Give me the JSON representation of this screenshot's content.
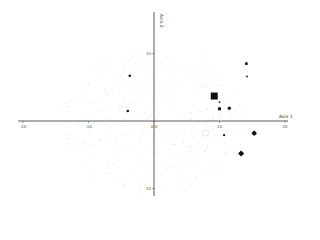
{
  "chart_data": {
    "type": "scatter",
    "title": "",
    "xlabel": "Axis 1",
    "ylabel": "Axis 2",
    "xlim": [
      -20,
      20
    ],
    "ylim": [
      -10,
      12
    ],
    "grid": false,
    "legend": null,
    "x_ticks": [
      {
        "value": -20,
        "label": "-20"
      },
      {
        "value": -10,
        "label": "-10"
      },
      {
        "value": 0,
        "label": "0.0"
      },
      {
        "value": 10,
        "label": "10"
      },
      {
        "value": 20,
        "label": "20"
      }
    ],
    "y_ticks": [
      {
        "value": 10,
        "label": "10"
      },
      {
        "value": -10,
        "label": "-10"
      }
    ],
    "series": [
      {
        "name": "background points",
        "marker": "faint-dot",
        "color": "#d8d8d8",
        "points": "many light grey points scattered around origin"
      },
      {
        "name": "highlighted",
        "color": "#111111",
        "points": [
          {
            "x": -3.7,
            "y": 6.7,
            "marker": "dot",
            "size": 2.5
          },
          {
            "x": -4.0,
            "y": 1.5,
            "marker": "dot",
            "size": 2.5
          },
          {
            "x": 9.2,
            "y": 3.7,
            "marker": "square",
            "size": 7
          },
          {
            "x": 10.0,
            "y": 2.8,
            "marker": "dot",
            "size": 1.8
          },
          {
            "x": 10.0,
            "y": 1.8,
            "marker": "square",
            "size": 3
          },
          {
            "x": 11.5,
            "y": 1.9,
            "marker": "diamond",
            "size": 4
          },
          {
            "x": 14.1,
            "y": 8.5,
            "marker": "square",
            "size": 2.6
          },
          {
            "x": 14.2,
            "y": 6.6,
            "marker": "dot",
            "size": 1.8
          },
          {
            "x": 15.3,
            "y": -1.8,
            "marker": "diamond",
            "size": 5.5
          },
          {
            "x": 13.3,
            "y": -4.8,
            "marker": "diamond",
            "size": 6
          },
          {
            "x": 10.7,
            "y": -2.1,
            "marker": "dot",
            "size": 2.2
          },
          {
            "x": 7.9,
            "y": -1.8,
            "marker": "open-circle",
            "size": 6,
            "color": "#dddddd"
          }
        ]
      }
    ]
  },
  "axes": {
    "x_title": "Axis 1",
    "y_title": "Axis 2",
    "x_tick_labels": [
      "-20",
      "-10",
      "0.0",
      "10",
      "20"
    ],
    "y_tick_labels": [
      "10",
      "-10"
    ]
  }
}
